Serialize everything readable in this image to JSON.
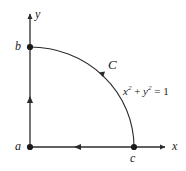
{
  "figure": {
    "type": "math-diagram",
    "background_color": "#ffffff",
    "stroke_color": "#2b2b2b",
    "axes": {
      "x_label": "x",
      "y_label": "y",
      "origin": {
        "x": 30,
        "y": 147
      },
      "x_axis_end": {
        "x": 167,
        "y": 147
      },
      "y_axis_end": {
        "x": 30,
        "y": 12
      }
    },
    "points": [
      {
        "name": "a",
        "label": "a",
        "x": 30,
        "y": 147
      },
      {
        "name": "b",
        "label": "b",
        "x": 30,
        "y": 47
      },
      {
        "name": "c",
        "label": "c",
        "x": 134,
        "y": 147
      }
    ],
    "curve": {
      "label": "C",
      "equation": "x2 + y2 = 1",
      "equation_parts": {
        "x_var": "x",
        "x_exp": "2",
        "plus": " + ",
        "y_var": "y",
        "y_exp": "2",
        "equals": " = 1"
      },
      "radius": 104,
      "from": "b",
      "to": "c",
      "direction": "counterclockwise"
    },
    "arrows": [
      {
        "name": "y-axis-arrow",
        "direction": "up"
      },
      {
        "name": "x-axis-arrow",
        "direction": "right"
      },
      {
        "name": "segment-a-to-b-arrow",
        "direction": "up"
      },
      {
        "name": "segment-c-to-a-arrow",
        "direction": "left"
      },
      {
        "name": "arc-arrow",
        "direction": "counterclockwise"
      }
    ]
  }
}
